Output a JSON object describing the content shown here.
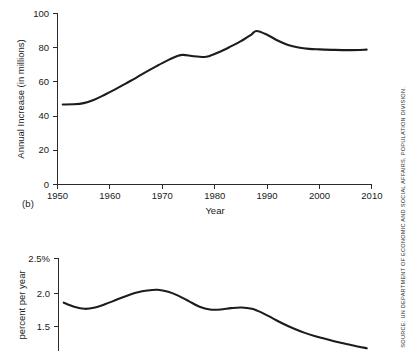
{
  "figure": {
    "panel_label_b": "(b)",
    "source_credit": "SOURCE: UN DEPARTMENT OF ECONOMIC AND SOCIAL AFFAIRS, POPULATION DIVISION."
  },
  "chart_data": [
    {
      "type": "line",
      "title": "",
      "xlabel": "Year",
      "ylabel": "Annual Increase (in millions)",
      "xlim": [
        1950,
        2010
      ],
      "ylim": [
        0,
        100
      ],
      "xticks": [
        1950,
        1960,
        1970,
        1980,
        1990,
        2000,
        2010
      ],
      "xtick_labels": [
        "1950",
        "1960",
        "1970",
        "1980",
        "1990",
        "2000",
        "2010"
      ],
      "yticks": [
        0,
        20,
        40,
        60,
        80,
        100
      ],
      "ytick_labels": [
        "0",
        "20",
        "40",
        "60",
        "80",
        "100"
      ],
      "grid": false,
      "legend": "none",
      "series": [
        {
          "name": "Annual increase of world population",
          "x": [
            1951,
            1953,
            1955,
            1957,
            1959,
            1961,
            1963,
            1965,
            1967,
            1969,
            1971,
            1973,
            1974,
            1976,
            1978,
            1979,
            1981,
            1983,
            1985,
            1987,
            1988,
            1990,
            1992,
            1994,
            1996,
            1998,
            2000,
            2003,
            2006,
            2009
          ],
          "values": [
            46.8,
            46.9,
            47.6,
            49.6,
            52.5,
            55.6,
            59.0,
            62.4,
            66.0,
            69.4,
            72.6,
            75.3,
            75.8,
            75.0,
            74.6,
            75.2,
            77.6,
            80.6,
            83.8,
            87.7,
            89.8,
            87.6,
            84.2,
            81.6,
            80.1,
            79.3,
            79.0,
            78.7,
            78.6,
            78.9
          ]
        }
      ]
    },
    {
      "type": "line",
      "title": "",
      "xlabel": "",
      "ylabel": "percent per year",
      "xlim": [
        1950,
        2010
      ],
      "ylim": [
        1.0,
        2.5
      ],
      "xticks": [],
      "xtick_labels": [],
      "yticks": [
        1.5,
        2.0,
        2.5
      ],
      "ytick_labels": [
        "1.5",
        "2.0",
        "2.5%"
      ],
      "grid": false,
      "legend": "none",
      "note": "lower panel is cropped by the bottom edge of the image",
      "series": [
        {
          "name": "World population growth rate",
          "x": [
            1951,
            1953,
            1955,
            1957,
            1959,
            1961,
            1963,
            1965,
            1967,
            1969,
            1971,
            1973,
            1975,
            1977,
            1979,
            1981,
            1983,
            1985,
            1987,
            1989,
            1991,
            1993,
            1995,
            1997,
            1999,
            2001,
            2004,
            2007,
            2009
          ],
          "values": [
            1.85,
            1.79,
            1.76,
            1.78,
            1.83,
            1.89,
            1.95,
            2.0,
            2.03,
            2.04,
            2.01,
            1.95,
            1.87,
            1.79,
            1.75,
            1.75,
            1.77,
            1.78,
            1.76,
            1.7,
            1.62,
            1.54,
            1.47,
            1.41,
            1.36,
            1.32,
            1.26,
            1.21,
            1.18
          ]
        }
      ]
    }
  ]
}
